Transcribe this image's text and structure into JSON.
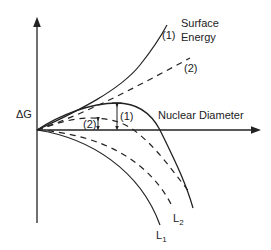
{
  "diagram": {
    "title": "",
    "axes": {
      "y_label": "ΔG",
      "x_label": "Nuclear Diameter"
    },
    "curves": {
      "surface_energy_label_line1": "Surface",
      "surface_energy_label_line2": "Energy",
      "surface_1": "(1)",
      "surface_2": "(2)",
      "barrier_1": "(1)",
      "barrier_2": "(2)",
      "volume_1_main": "L",
      "volume_1_sub": "1",
      "volume_2_main": "L",
      "volume_2_sub": "2"
    },
    "colors": {
      "line": "#222222",
      "background": "#ffffff"
    }
  }
}
